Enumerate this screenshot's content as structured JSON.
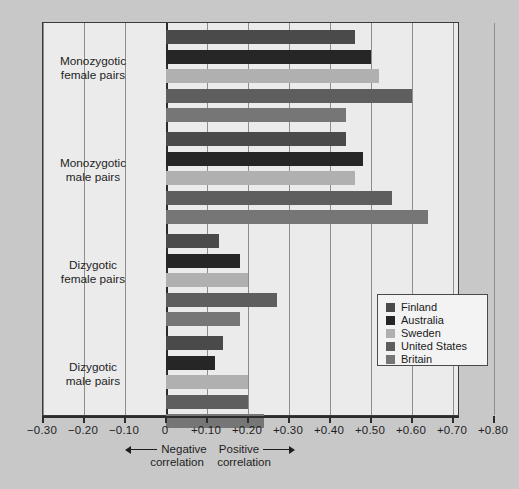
{
  "chart_data": {
    "type": "bar",
    "orientation": "horizontal",
    "title": "",
    "xlabel": "",
    "ylabel": "",
    "xlim": [
      -0.3,
      0.8
    ],
    "grid": true,
    "legend_position": "middle-right",
    "categories": [
      "Monozygotic female pairs",
      "Monozygotic male pairs",
      "Dizygotic female pairs",
      "Dizygotic male pairs"
    ],
    "series": [
      {
        "name": "Finland",
        "color": "#4a4a4a",
        "values": [
          0.46,
          0.44,
          0.13,
          0.14
        ]
      },
      {
        "name": "Australia",
        "color": "#262626",
        "values": [
          0.5,
          0.48,
          0.18,
          0.12
        ]
      },
      {
        "name": "Sweden",
        "color": "#b0b0b0",
        "values": [
          0.52,
          0.46,
          0.2,
          0.2
        ]
      },
      {
        "name": "United States",
        "color": "#5e5e5e",
        "values": [
          0.6,
          0.55,
          0.27,
          0.2
        ]
      },
      {
        "name": "Britain",
        "color": "#767676",
        "values": [
          0.44,
          0.64,
          0.18,
          0.24
        ]
      }
    ],
    "xticks": [
      -0.3,
      -0.2,
      -0.1,
      0,
      0.1,
      0.2,
      0.3,
      0.4,
      0.5,
      0.6,
      0.7,
      0.8
    ],
    "xticklabels": [
      "−0.30",
      "−0.20",
      "−0.10",
      "0",
      "+0.10",
      "+0.20",
      "+0.30",
      "+0.40",
      "+0.50",
      "+0.60",
      "+0.70",
      "+0.80"
    ],
    "annotations": [
      {
        "id": "negative",
        "line1": "Negative",
        "line2": "correlation",
        "arrow": "left"
      },
      {
        "id": "positive",
        "line1": "Positive",
        "line2": "correlation",
        "arrow": "right"
      }
    ]
  },
  "group_labels": [
    {
      "line1": "Monozygotic",
      "line2": "female pairs"
    },
    {
      "line1": "Monozygotic",
      "line2": "male pairs"
    },
    {
      "line1": "Dizygotic",
      "line2": "female pairs"
    },
    {
      "line1": "Dizygotic",
      "line2": "male pairs"
    }
  ],
  "legend": {
    "items": [
      {
        "label": "Finland",
        "color": "#4a4a4a"
      },
      {
        "label": "Australia",
        "color": "#262626"
      },
      {
        "label": "Sweden",
        "color": "#b0b0b0"
      },
      {
        "label": "United States",
        "color": "#5e5e5e"
      },
      {
        "label": "Britain",
        "color": "#767676"
      }
    ]
  },
  "colors": {
    "page_background": "#c8c8c8",
    "plot_background": "#ebebeb",
    "frame": "#3a3a3a",
    "gridline": "#8d8d8d",
    "zero_line": "#2c2c2c",
    "text": "#1e1e1e"
  }
}
